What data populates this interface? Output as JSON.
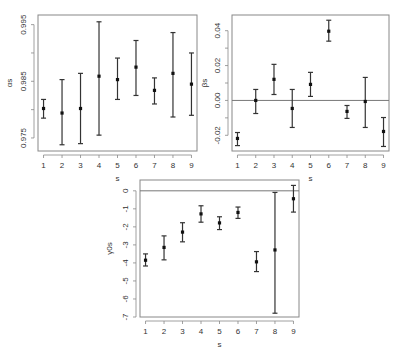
{
  "chart_data": [
    {
      "type": "scatter",
      "subtype": "errorbar",
      "title": "",
      "xlabel": "s",
      "ylabel": "αs",
      "x": [
        1,
        2,
        3,
        4,
        5,
        6,
        7,
        8,
        9
      ],
      "y": [
        0.9802,
        0.9794,
        0.9802,
        0.9859,
        0.9853,
        0.9875,
        0.9834,
        0.9864,
        0.9845
      ],
      "y_upper": [
        0.9818,
        0.9853,
        0.9864,
        0.9955,
        0.9891,
        0.9922,
        0.9856,
        0.9936,
        0.99
      ],
      "y_lower": [
        0.9785,
        0.9738,
        0.974,
        0.9755,
        0.9818,
        0.9825,
        0.981,
        0.9787,
        0.979
      ],
      "xlim": [
        0.7,
        9.3
      ],
      "ylim": [
        0.9727,
        0.9967
      ],
      "xticks": [
        "1",
        "2",
        "3",
        "4",
        "5",
        "6",
        "7",
        "8",
        "9"
      ],
      "yticks": [
        "0.975",
        "0.985",
        "0.995"
      ],
      "ytick_values": [
        0.975,
        0.985,
        0.995
      ],
      "yminor_ticks": [
        0.98,
        0.99
      ],
      "reference_line": null,
      "grid": false,
      "legend": null
    },
    {
      "type": "scatter",
      "subtype": "errorbar",
      "title": "",
      "xlabel": "s",
      "ylabel": "βs",
      "x": [
        1,
        2,
        3,
        4,
        5,
        6,
        7,
        8,
        9
      ],
      "y": [
        -0.0218,
        0.0,
        0.0121,
        -0.0046,
        0.0092,
        0.0397,
        -0.0063,
        -0.0006,
        -0.0178
      ],
      "y_upper": [
        -0.0184,
        0.0063,
        0.0207,
        0.0063,
        0.0161,
        0.046,
        -0.0029,
        0.0132,
        -0.0098
      ],
      "y_lower": [
        -0.0259,
        -0.0075,
        0.0034,
        -0.0155,
        0.0023,
        0.034,
        -0.0103,
        -0.0155,
        -0.0264
      ],
      "xlim": [
        0.7,
        9.3
      ],
      "ylim": [
        -0.029,
        0.049
      ],
      "xticks": [
        "1",
        "2",
        "3",
        "4",
        "5",
        "6",
        "7",
        "8",
        "9"
      ],
      "yticks": [
        "-0.02",
        "0.00",
        "0.02",
        "0.04"
      ],
      "ytick_values": [
        -0.02,
        0.0,
        0.02,
        0.04
      ],
      "yminor_ticks": [
        -0.01,
        0.01,
        0.03
      ],
      "reference_line": 0,
      "grid": false,
      "legend": null
    },
    {
      "type": "scatter",
      "subtype": "errorbar",
      "title": "",
      "xlabel": "s",
      "ylabel": "γ0s",
      "x": [
        1,
        2,
        3,
        4,
        5,
        6,
        7,
        8,
        9
      ],
      "y": [
        -3.85,
        -3.14,
        -2.29,
        -1.28,
        -1.78,
        -1.2,
        -3.94,
        -3.28,
        -0.44
      ],
      "y_upper": [
        -3.5,
        -2.5,
        -1.77,
        -0.83,
        -1.44,
        -0.9,
        -3.37,
        -0.09,
        0.3
      ],
      "y_lower": [
        -4.17,
        -3.83,
        -2.83,
        -1.74,
        -2.15,
        -1.53,
        -4.48,
        -6.79,
        -1.18
      ],
      "xlim": [
        0.7,
        9.3
      ],
      "ylim": [
        -7.0,
        0.6
      ],
      "xticks": [
        "1",
        "2",
        "3",
        "4",
        "5",
        "6",
        "7",
        "8",
        "9"
      ],
      "yticks": [
        "0",
        "-1",
        "-2",
        "-3",
        "-4",
        "-5",
        "-6",
        "-7"
      ],
      "ytick_values": [
        0,
        -1,
        -2,
        -3,
        -4,
        -5,
        -6,
        -7
      ],
      "yminor_ticks": [],
      "reference_line": 0,
      "grid": false,
      "legend": null
    }
  ],
  "layout": {
    "panels": [
      {
        "box": {
          "left": 38,
          "top": 15,
          "right": 197,
          "bottom": 151
        },
        "ylabel_x": 12
      },
      {
        "box": {
          "left": 232,
          "top": 15,
          "right": 389,
          "bottom": 151
        },
        "ylabel_x": 207
      },
      {
        "box": {
          "left": 140,
          "top": 180,
          "right": 299,
          "bottom": 317
        },
        "ylabel_x": 112
      }
    ],
    "colors": {
      "axis": "#888888",
      "errorbar": "#333333",
      "point": "#111111",
      "reference_line": "#777777",
      "text": "#333333"
    }
  }
}
